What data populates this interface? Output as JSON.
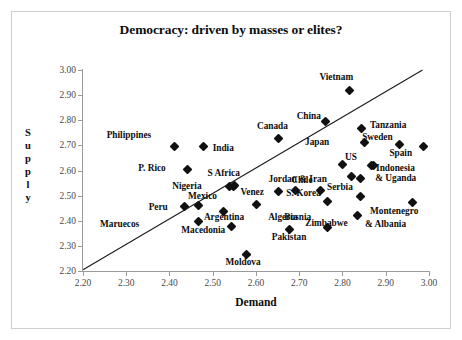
{
  "chart_data": {
    "type": "scatter",
    "title": "Democracy: driven by masses or elites?",
    "xlabel": "Demand",
    "ylabel": "Supply",
    "ylabel_letters": [
      "S",
      "u",
      "p",
      "p",
      "l",
      "y"
    ],
    "xlim": [
      2.2,
      3.0
    ],
    "ylim": [
      2.2,
      3.0
    ],
    "xticks": [
      "2.20",
      "2.30",
      "2.40",
      "2.50",
      "2.60",
      "2.70",
      "2.80",
      "2.90",
      "3.00"
    ],
    "yticks": [
      "3.00",
      "2.90",
      "2.80",
      "2.70",
      "2.60",
      "2.50",
      "2.40",
      "2.30",
      "2.20"
    ],
    "grid": false,
    "legend": "none",
    "marker_color": "#111111",
    "marker_shape": "diamond",
    "trendline": {
      "x0": 2.2,
      "y0": 2.205,
      "x1": 2.985,
      "y1": 3.0,
      "color": "#1a1a1a"
    },
    "points": [
      {
        "label": "Philippines",
        "x": 2.412,
        "y": 2.694,
        "lx": -68,
        "ly": -12
      },
      {
        "label": "India",
        "x": 2.479,
        "y": 2.694,
        "lx": 9,
        "ly": 1
      },
      {
        "label": "P. Rico",
        "x": 2.441,
        "y": 2.605,
        "lx": -49,
        "ly": -1
      },
      {
        "label": "Nigeria",
        "x": 2.538,
        "y": 2.536,
        "lx": -57,
        "ly": -1
      },
      {
        "label": "S Africa",
        "x": 2.548,
        "y": 2.537,
        "lx": -26,
        "ly": -13
      },
      {
        "label": "Peru",
        "x": 2.435,
        "y": 2.456,
        "lx": -36,
        "ly": 0
      },
      {
        "label": "Mexico",
        "x": 2.466,
        "y": 2.462,
        "lx": -10,
        "ly": -9
      },
      {
        "label": "Maruecos",
        "x": null,
        "y": null,
        "lx": 100,
        "ly": 219,
        "absolute": true
      },
      {
        "label": "Argentina",
        "x": 2.468,
        "y": 2.397,
        "lx": 5,
        "ly": -5
      },
      {
        "label": "Macedonia",
        "x": 2.543,
        "y": 2.379,
        "lx": -50,
        "ly": 4
      },
      {
        "label": "Venez",
        "x": 2.601,
        "y": 2.464,
        "lx": -16,
        "ly": -13
      },
      {
        "label": "Algeria",
        "x": 2.524,
        "y": 2.438,
        "lx": 45,
        "ly": 6
      },
      {
        "label": "Moldova",
        "x": 2.578,
        "y": 2.265,
        "lx": -21,
        "ly": 7
      },
      {
        "label": "Pakistan",
        "x": 2.678,
        "y": 2.364,
        "lx": -18,
        "ly": 7
      },
      {
        "label": "Canada",
        "x": 2.653,
        "y": 2.728,
        "lx": -22,
        "ly": -12
      },
      {
        "label": "China",
        "x": 2.761,
        "y": 2.795,
        "lx": -29,
        "ly": -6
      },
      {
        "label": "Jordan & Iran",
        "x": 2.652,
        "y": 2.517,
        "lx": -10,
        "ly": -12
      },
      {
        "label": "Chile",
        "x": 2.691,
        "y": 2.522,
        "lx": -4,
        "ly": -10
      },
      {
        "label": "Serbia",
        "x": 2.748,
        "y": 2.521,
        "lx": 7,
        "ly": -3
      },
      {
        "label": "S. Korea",
        "x": 2.765,
        "y": 2.475,
        "lx": -41,
        "ly": -9
      },
      {
        "label": "Bosnia",
        "x": 2.765,
        "y": 2.375,
        "lx": -43,
        "ly": -10
      },
      {
        "label": "Zimbabwe",
        "x": 2.834,
        "y": 2.421,
        "lx": -52,
        "ly": 8
      },
      {
        "label": "Vietnam",
        "x": 2.816,
        "y": 2.919,
        "lx": -30,
        "ly": -13
      },
      {
        "label": "Tanzania",
        "x": 2.845,
        "y": 2.767,
        "lx": 8,
        "ly": -4
      },
      {
        "label": "Japan",
        "x": 2.852,
        "y": 2.711,
        "lx": -60,
        "ly": -1
      },
      {
        "label": "US",
        "x": 2.801,
        "y": 2.625,
        "lx": 2,
        "ly": -7
      },
      {
        "label": "Sweden",
        "x": 2.931,
        "y": 2.704,
        "lx": -37,
        "ly": -7
      },
      {
        "label": "Spain",
        "x": 2.987,
        "y": 2.694,
        "lx": -34,
        "ly": 6
      },
      {
        "label": "Indonesia",
        "x": 2.866,
        "y": 2.618,
        "lx": 5,
        "ly": 2
      },
      {
        "label": "& Uganda",
        "x": 2.871,
        "y": 2.62,
        "lx": 2,
        "ly": 13
      },
      {
        "label": "Montenegro",
        "x": 2.963,
        "y": 2.473,
        "lx": -43,
        "ly": 9
      },
      {
        "label": "& Albania",
        "x": null,
        "y": null,
        "lx": 365,
        "ly": 219,
        "absolute": true
      },
      {
        "label": "",
        "x": 2.821,
        "y": 2.578,
        "lx": 0,
        "ly": 0
      },
      {
        "label": "",
        "x": 2.841,
        "y": 2.57,
        "lx": 0,
        "ly": 0
      },
      {
        "label": "",
        "x": 2.842,
        "y": 2.496,
        "lx": 0,
        "ly": 0
      },
      {
        "label": "",
        "x": 2.551,
        "y": 2.539,
        "lx": 0,
        "ly": 0
      }
    ]
  }
}
